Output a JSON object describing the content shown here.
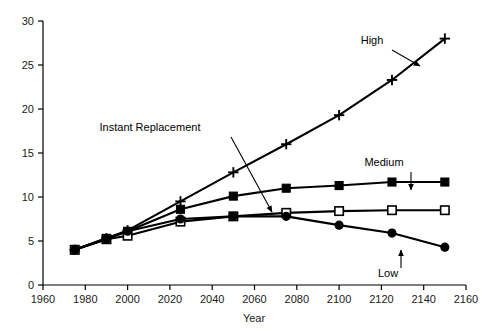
{
  "chart_data": {
    "type": "line",
    "title": "",
    "xlabel": "Year",
    "ylabel": "",
    "xlim": [
      1960,
      2160
    ],
    "ylim": [
      0,
      30
    ],
    "xticks": [
      1960,
      1980,
      2000,
      2020,
      2040,
      2060,
      2080,
      2100,
      2120,
      2140,
      2160
    ],
    "yticks": [
      0,
      5,
      10,
      15,
      20,
      25,
      30
    ],
    "grid": false,
    "legend": "inline-annotations",
    "x": [
      1975,
      1990,
      2000,
      2025,
      2050,
      2075,
      2100,
      2125,
      2150
    ],
    "series": [
      {
        "name": "High",
        "marker": "plus",
        "values": [
          4.0,
          5.3,
          6.2,
          9.5,
          12.8,
          16.0,
          19.3,
          23.3,
          28.0
        ]
      },
      {
        "name": "Medium",
        "marker": "filled-square",
        "values": [
          4.0,
          5.3,
          6.1,
          8.6,
          10.1,
          11.0,
          11.3,
          11.7,
          11.7
        ]
      },
      {
        "name": "Instant Replacement",
        "marker": "open-square",
        "values": [
          4.0,
          5.2,
          5.6,
          7.2,
          7.8,
          8.2,
          8.4,
          8.5,
          8.5
        ]
      },
      {
        "name": "Low",
        "marker": "filled-circle",
        "values": [
          4.0,
          5.2,
          6.1,
          7.5,
          7.8,
          7.8,
          6.8,
          5.9,
          4.3
        ]
      }
    ],
    "annotations": [
      {
        "label": "High",
        "text_x": 372,
        "text_y": 44,
        "arrow": [
          [
            392,
            50
          ],
          [
            420,
            66
          ]
        ]
      },
      {
        "label": "Medium",
        "text_x": 384,
        "text_y": 166,
        "arrow": [
          [
            411,
            172
          ],
          [
            411,
            190
          ]
        ]
      },
      {
        "label": "Instant Replacement",
        "text_x": 150,
        "text_y": 131,
        "arrow": [
          [
            231,
            137
          ],
          [
            272,
            212
          ]
        ]
      },
      {
        "label": "Low",
        "text_x": 388,
        "text_y": 277,
        "arrow": [
          [
            401,
            268
          ],
          [
            401,
            250
          ]
        ]
      }
    ]
  },
  "colors": {
    "ink": "#000000",
    "background": "#ffffff"
  }
}
